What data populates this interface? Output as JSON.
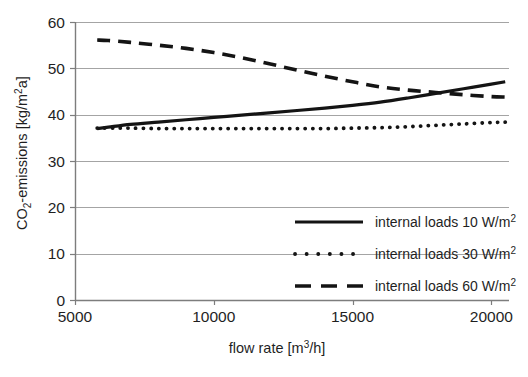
{
  "chart_data": {
    "type": "line",
    "title": "",
    "subtitle": "",
    "xlabel": "flow rate [m³/h]",
    "ylabel": "CO₂-emissions [kg/m²a]",
    "ylabel_parts": {
      "pre": "CO",
      "sub": "2",
      "post": "-emissions [kg/m",
      "sup": "2",
      "tail": "a]"
    },
    "xlabel_parts": {
      "pre": "flow rate [m",
      "sup": "3",
      "post": "/h]"
    },
    "xlim": [
      5000,
      20600
    ],
    "ylim": [
      0,
      60
    ],
    "xticks": [
      5000,
      10000,
      15000,
      20000
    ],
    "xtick_labels": [
      "5000",
      "10000",
      "15000",
      "20000"
    ],
    "yticks": [
      0,
      10,
      20,
      30,
      40,
      50,
      60
    ],
    "ytick_labels": [
      "0",
      "10",
      "20",
      "30",
      "40",
      "50",
      "60"
    ],
    "grid": "horizontal",
    "legend_position": "lower-right-inside",
    "series": [
      {
        "name": "internal loads 10 W/m²",
        "label_parts": {
          "text": "internal loads 10 W/m",
          "sup": "2"
        },
        "style": "solid",
        "color": "#141414",
        "x": [
          5800,
          6200,
          7000,
          8000,
          9000,
          10000,
          11000,
          12000,
          13000,
          14000,
          15000,
          16000,
          17000,
          18000,
          19000,
          20000,
          20500
        ],
        "values": [
          37.0,
          37.3,
          37.9,
          38.4,
          38.9,
          39.4,
          39.9,
          40.4,
          40.9,
          41.4,
          42.0,
          42.7,
          43.6,
          44.6,
          45.6,
          46.6,
          47.1
        ]
      },
      {
        "name": "internal loads 30 W/m²",
        "label_parts": {
          "text": "internal loads 30 W/m",
          "sup": "2"
        },
        "style": "dotted",
        "color": "#141414",
        "x": [
          5800,
          6200,
          7000,
          8000,
          9000,
          10000,
          11000,
          12000,
          13000,
          14000,
          15000,
          16000,
          17000,
          18000,
          19000,
          20000,
          20500
        ],
        "values": [
          37.1,
          37.1,
          37.1,
          37.0,
          37.0,
          37.0,
          37.0,
          37.0,
          37.0,
          37.0,
          37.1,
          37.2,
          37.4,
          37.7,
          38.0,
          38.3,
          38.4
        ]
      },
      {
        "name": "internal loads 60 W/m²",
        "label_parts": {
          "text": "internal loads 60 W/m",
          "sup": "2"
        },
        "style": "dashed",
        "color": "#141414",
        "x": [
          5800,
          6200,
          7000,
          8000,
          9000,
          10000,
          11000,
          12000,
          13000,
          14000,
          15000,
          16000,
          17000,
          18000,
          19000,
          20000,
          20500
        ],
        "values": [
          56.1,
          56.0,
          55.6,
          55.0,
          54.3,
          53.4,
          52.3,
          51.0,
          49.6,
          48.3,
          47.1,
          46.0,
          45.3,
          44.8,
          44.3,
          43.9,
          43.8
        ]
      }
    ],
    "annotations": []
  },
  "legend": {
    "entries": [
      {
        "swatch": "solid-line-swatch",
        "label": "internal loads 10 W/m²"
      },
      {
        "swatch": "dotted-line-swatch",
        "label": "internal loads 30 W/m²"
      },
      {
        "swatch": "dashed-line-swatch",
        "label": "internal loads 60 W/m²"
      }
    ]
  },
  "colors": {
    "ink": "#141414",
    "grid": "#9a9a9a",
    "axis": "#7d7d7d",
    "background": "#ffffff"
  }
}
